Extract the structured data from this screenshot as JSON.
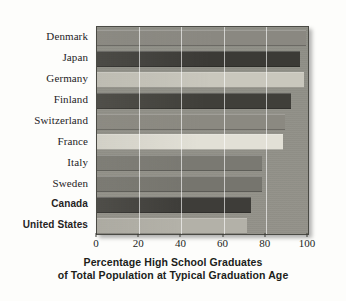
{
  "chart_data": {
    "type": "bar",
    "orientation": "horizontal",
    "title": "",
    "caption_line1": "Percentage High School Graduates",
    "caption_line2": "of Total Population at Typical Graduation Age",
    "xlabel": "Percentage High School Graduates of Total Population at Typical Graduation Age",
    "ylabel": "",
    "xlim": [
      0,
      100
    ],
    "xticks": [
      0,
      20,
      40,
      60,
      80,
      100
    ],
    "xticklabels": [
      "0",
      "20",
      "40",
      "60",
      "80",
      "100"
    ],
    "grid": true,
    "grid_axis": "x",
    "legend": null,
    "categories": [
      "Denmark",
      "Japan",
      "Germany",
      "Finland",
      "Switzerland",
      "France",
      "Italy",
      "Sweden",
      "Canada",
      "United States"
    ],
    "values": [
      99,
      96,
      98,
      92,
      89,
      88,
      78,
      78,
      73,
      71
    ],
    "bars": [
      {
        "label": "Denmark",
        "value": 99,
        "color": "#8a8881",
        "emphasis": false
      },
      {
        "label": "Japan",
        "value": 96,
        "color": "#3b3a36",
        "emphasis": false
      },
      {
        "label": "Germany",
        "value": 98,
        "color": "#c9c7bd",
        "emphasis": false
      },
      {
        "label": "Finland",
        "value": 92,
        "color": "#403f3a",
        "emphasis": false
      },
      {
        "label": "Switzerland",
        "value": 89,
        "color": "#8b8981",
        "emphasis": false
      },
      {
        "label": "France",
        "value": 88,
        "color": "#e2e0d6",
        "emphasis": false
      },
      {
        "label": "Italy",
        "value": 78,
        "color": "#7a7972",
        "emphasis": false
      },
      {
        "label": "Sweden",
        "value": 78,
        "color": "#76756e",
        "emphasis": false
      },
      {
        "label": "Canada",
        "value": 73,
        "color": "#3e3d39",
        "emphasis": true
      },
      {
        "label": "United States",
        "value": 71,
        "color": "#b3b1a8",
        "emphasis": true
      }
    ],
    "colors": {
      "plot_background": "#8e8e86",
      "frame_border": "#4a4a44",
      "gridline": "#ffffff",
      "page_background": "#fdfdfb",
      "text": "#25231f"
    }
  }
}
